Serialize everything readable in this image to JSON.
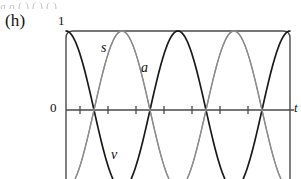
{
  "figure": {
    "panel_label": "(h)",
    "top_cropped_text": "g  q          (   ) (  )  (  )",
    "axis": {
      "y_top_label": "1",
      "y_zero_label": "0",
      "x_axis_label": "t",
      "x_tick_count": 7,
      "frame": {
        "left": 66,
        "right": 290,
        "top": 31,
        "bottom": 179
      },
      "zero_line_y": 110
    },
    "curve_labels": {
      "displacement": "s",
      "acceleration": "a",
      "velocity": "v"
    },
    "colors": {
      "displacement_curve": "#1a1a1a",
      "velocity_curve": "#8c8c8c",
      "acceleration_curve": "#8c8c8c",
      "axis": "#4a4a4a",
      "frame": "#4a4a4a",
      "background": "#ffffff"
    }
  },
  "chart_data": {
    "type": "line",
    "title": "",
    "xlabel": "t",
    "ylabel": "",
    "xlim": [
      0,
      12.566370614359172
    ],
    "ylim": [
      -1.35,
      1
    ],
    "grid": false,
    "legend": "inline-curve-labels",
    "x_ticks": [
      0.7853981633974483,
      2.356194490192345,
      3.9269908169872414,
      5.497787143782138,
      7.0685834705770345,
      8.63937979737193,
      10.210176124166829
    ],
    "x_tick_labels": [
      "",
      "",
      "",
      "",
      "",
      "",
      ""
    ],
    "y_ticks": [
      0,
      1
    ],
    "y_tick_labels": [
      "0",
      "1"
    ],
    "annotations": [
      {
        "text": "(h)",
        "x": -0.55,
        "y": 1.22
      },
      {
        "text": "s",
        "x": 1.15,
        "y": 0.72
      },
      {
        "text": "a",
        "x": 3.35,
        "y": 0.42
      },
      {
        "text": "v",
        "x": 1.85,
        "y": -0.55
      }
    ],
    "series": [
      {
        "name": "s",
        "label": "s",
        "formula": "cos(t)",
        "color": "#1a1a1a",
        "width": 1.7,
        "amplitude": 1,
        "phase": 0,
        "periods": 2,
        "samples_x": [
          0,
          0.7853981633974483,
          1.5707963267948966,
          2.356194490192345,
          3.141592653589793,
          3.9269908169872414,
          4.71238898038469,
          5.497787143782138,
          6.283185307179586,
          7.0685834705770345,
          7.853981633974483,
          8.63937979737193,
          9.42477796076938,
          10.210176124166829,
          10.995574287564276,
          11.780972450961723,
          12.566370614359172
        ],
        "samples_y": [
          1,
          0.7071,
          0,
          -0.7071,
          -1,
          -0.7071,
          0,
          0.7071,
          1,
          0.7071,
          0,
          -0.7071,
          -1,
          -0.7071,
          0,
          0.7071,
          1
        ]
      },
      {
        "name": "v",
        "label": "v",
        "formula": "-sin(t)",
        "color": "#8c8c8c",
        "width": 1.3,
        "amplitude": 1,
        "phase": 3.141592653589793,
        "periods": 2,
        "samples_x": [
          0,
          0.7853981633974483,
          1.5707963267948966,
          2.356194490192345,
          3.141592653589793,
          3.9269908169872414,
          4.71238898038469,
          5.497787143782138,
          6.283185307179586,
          7.0685834705770345,
          7.853981633974483,
          8.63937979737193,
          9.42477796076938,
          10.210176124166829,
          10.995574287564276,
          11.780972450961723,
          12.566370614359172
        ],
        "samples_y": [
          0,
          -0.7071,
          -1,
          -0.7071,
          0,
          0.7071,
          1,
          0.7071,
          0,
          -0.7071,
          -1,
          -0.7071,
          0,
          0.7071,
          1,
          0.7071,
          0
        ]
      },
      {
        "name": "a",
        "label": "a",
        "formula": "-cos(t)",
        "color": "#8c8c8c",
        "width": 1.3,
        "amplitude": 1,
        "phase": 3.141592653589793,
        "periods": 2,
        "samples_x": [
          0,
          0.7853981633974483,
          1.5707963267948966,
          2.356194490192345,
          3.141592653589793,
          3.9269908169872414,
          4.71238898038469,
          5.497787143782138,
          6.283185307179586,
          7.0685834705770345,
          7.853981633974483,
          8.63937979737193,
          9.42477796076938,
          10.210176124166829,
          10.995574287564276,
          11.780972450961723,
          12.566370614359172
        ],
        "samples_y": [
          -1,
          -0.7071,
          0,
          0.7071,
          1,
          0.7071,
          0,
          -0.7071,
          -1,
          -0.7071,
          0,
          0.7071,
          1,
          0.7071,
          0,
          -0.7071,
          -1
        ]
      }
    ]
  }
}
